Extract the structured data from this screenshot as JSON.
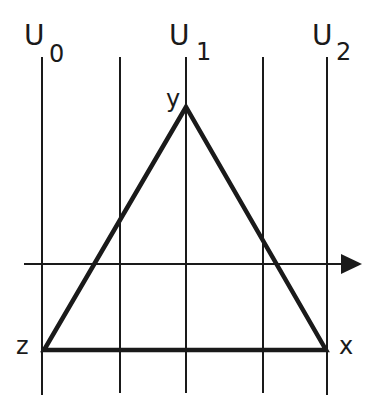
{
  "diagram": {
    "lines": [
      {
        "label": "U",
        "subscript": "0",
        "x": 42
      },
      {
        "label": "",
        "subscript": "",
        "x": 120
      },
      {
        "label": "U",
        "subscript": "1",
        "x": 186
      },
      {
        "label": "",
        "subscript": "",
        "x": 263
      },
      {
        "label": "U",
        "subscript": "2",
        "x": 327
      }
    ],
    "axis": {
      "y": 264,
      "direction": "right"
    },
    "triangle": {
      "vertices": [
        {
          "name": "y",
          "x": 186,
          "y": 107
        },
        {
          "name": "z",
          "x": 44,
          "y": 350
        },
        {
          "name": "x",
          "x": 326,
          "y": 350
        }
      ]
    },
    "labels": {
      "u0_main": "U",
      "u0_sub": "0",
      "u1_main": "U",
      "u1_sub": "1",
      "u2_main": "U",
      "u2_sub": "2",
      "y": "y",
      "z": "z",
      "x": "x"
    },
    "colors": {
      "stroke": "#1a1a1a",
      "background": "#ffffff"
    }
  }
}
